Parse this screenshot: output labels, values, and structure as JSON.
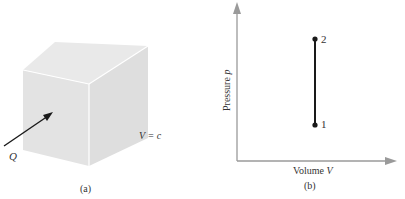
{
  "panel_a": {
    "caption": "(a)",
    "heat_label": "Q",
    "volume_label": "V = c",
    "box_colors": {
      "front": "#e2e2e2",
      "top": "#e9e9e9",
      "side": "#dcdcdc",
      "edge": "#ffffff"
    }
  },
  "panel_b": {
    "caption": "(b)",
    "x_axis_label_prefix": "Volume ",
    "x_axis_label_var": "V",
    "y_axis_label_prefix": "Pressure ",
    "y_axis_label_var": "p",
    "points": [
      {
        "label": "1"
      },
      {
        "label": "2"
      }
    ],
    "axis_color": "#9a9a9a",
    "line_color": "#1a1a1a"
  }
}
